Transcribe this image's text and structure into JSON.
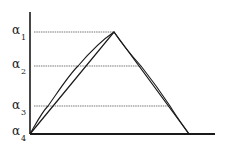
{
  "diagram": {
    "type": "triangular-membership-with-alpha-cuts",
    "colors": {
      "ink": "#1a1a1a",
      "guide": "#555555",
      "background": "#ffffff"
    },
    "axes": {
      "y_axis": {
        "x": 30,
        "y_top": 12,
        "y_bottom": 134
      },
      "x_axis": {
        "y": 134,
        "x_left": 30,
        "x_right": 215
      }
    },
    "triangle": {
      "left": [
        30,
        134
      ],
      "peak": [
        114,
        32
      ],
      "right": [
        189,
        134
      ]
    },
    "alpha_levels": [
      {
        "symbol": "α",
        "subscript": "1",
        "y": 32,
        "line_to_x": 114
      },
      {
        "symbol": "α",
        "subscript": "2",
        "y": 66,
        "line_to_x": 141
      },
      {
        "symbol": "α",
        "subscript": "3",
        "y": 106,
        "line_to_x": 170
      },
      {
        "symbol": "α",
        "subscript": "4",
        "y": 134,
        "line_to_x": null
      }
    ],
    "labels": {
      "a1": "α",
      "a1_sub": "1",
      "a2": "α",
      "a2_sub": "2",
      "a3": "α",
      "a3_sub": "3",
      "a4": "α",
      "a4_sub": "4"
    }
  }
}
